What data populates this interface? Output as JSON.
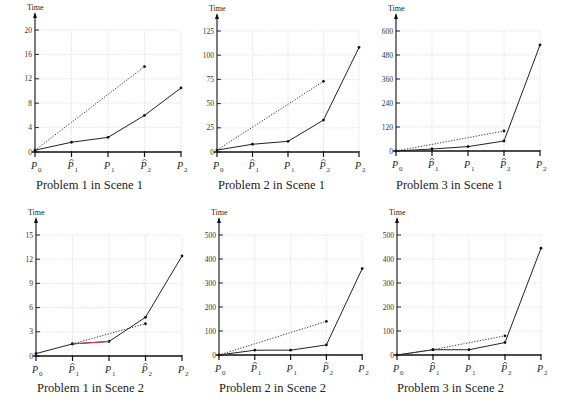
{
  "figure": {
    "y_axis_label": "Time",
    "x_tick_labels": [
      "P0",
      "P̂1",
      "P1",
      "P̂2",
      "P2"
    ],
    "colors": {
      "solid": "#222222",
      "dotted": "#333333",
      "highlight": "#d9334a",
      "grid": "#cfcfcf"
    }
  },
  "chart_data": [
    {
      "type": "line",
      "title": "Problem 1 in Scene 1",
      "ylabel": "Time",
      "categories": [
        "P0",
        "P̂1",
        "P1",
        "P̂2",
        "P2"
      ],
      "yticks": [
        0,
        4,
        8,
        12,
        16,
        20
      ],
      "ylim": [
        0,
        20
      ],
      "grid": true,
      "series": [
        {
          "name": "solid",
          "style": "solid",
          "x": [
            0,
            1,
            2,
            3,
            4
          ],
          "values": [
            0.3,
            1.6,
            2.4,
            6.0,
            10.5
          ]
        },
        {
          "name": "dotted",
          "style": "dotted",
          "x": [
            0,
            3
          ],
          "values": [
            0.3,
            14.0
          ]
        }
      ]
    },
    {
      "type": "line",
      "title": "Problem 2 in Scene 1",
      "ylabel": "Time",
      "categories": [
        "P0",
        "P̂1",
        "P1",
        "P̂2",
        "P2"
      ],
      "yticks": [
        0,
        25,
        50,
        75,
        100,
        125
      ],
      "ylim": [
        0,
        125
      ],
      "grid": true,
      "series": [
        {
          "name": "solid",
          "style": "solid",
          "x": [
            0,
            1,
            2,
            3,
            4
          ],
          "values": [
            2,
            8,
            11,
            33,
            108
          ]
        },
        {
          "name": "dotted",
          "style": "dotted",
          "x": [
            0,
            3
          ],
          "values": [
            2,
            73
          ]
        }
      ]
    },
    {
      "type": "line",
      "title": "Problem 3 in Scene 1",
      "ylabel": "Time",
      "categories": [
        "P0",
        "P̂1",
        "P1",
        "P̂2",
        "P2"
      ],
      "yticks": [
        0,
        120,
        240,
        360,
        480,
        600
      ],
      "ylim": [
        0,
        600
      ],
      "grid": true,
      "series": [
        {
          "name": "solid",
          "style": "solid",
          "x": [
            0,
            1,
            2,
            3,
            4
          ],
          "values": [
            0,
            10,
            22,
            50,
            530
          ]
        },
        {
          "name": "dotted",
          "style": "dotted",
          "x": [
            0,
            3
          ],
          "values": [
            0,
            100
          ]
        }
      ]
    },
    {
      "type": "line",
      "title": "Problem 1 in Scene 2",
      "ylabel": "Time",
      "categories": [
        "P0",
        "P̂1",
        "P1",
        "P̂2",
        "P2"
      ],
      "yticks": [
        0,
        3,
        6,
        9,
        12,
        15
      ],
      "ylim": [
        0,
        15
      ],
      "grid": true,
      "series": [
        {
          "name": "solid",
          "style": "solid",
          "x": [
            0,
            1,
            2,
            3,
            4
          ],
          "values": [
            0.3,
            1.5,
            1.8,
            4.8,
            12.4
          ]
        },
        {
          "name": "dotted",
          "style": "dotted",
          "x": [
            1,
            3
          ],
          "values": [
            1.5,
            4.0
          ]
        },
        {
          "name": "highlight",
          "style": "red",
          "x": [
            1,
            2
          ],
          "values": [
            1.5,
            1.8
          ]
        }
      ]
    },
    {
      "type": "line",
      "title": "Problem 2 in Scene 2",
      "ylabel": "Time",
      "categories": [
        "P0",
        "P̂1",
        "P1",
        "P̂2",
        "P2"
      ],
      "yticks": [
        0,
        100,
        200,
        300,
        400,
        500
      ],
      "ylim": [
        0,
        500
      ],
      "grid": true,
      "series": [
        {
          "name": "solid",
          "style": "solid",
          "x": [
            0,
            1,
            2,
            3,
            4
          ],
          "values": [
            0,
            20,
            20,
            42,
            360
          ]
        },
        {
          "name": "dotted",
          "style": "dotted",
          "x": [
            0,
            3
          ],
          "values": [
            0,
            140
          ]
        }
      ]
    },
    {
      "type": "line",
      "title": "Problem 3 in Scene 2",
      "ylabel": "Time",
      "categories": [
        "P0",
        "P̂1",
        "P1",
        "P̂2",
        "P2"
      ],
      "yticks": [
        0,
        100,
        200,
        300,
        400,
        500
      ],
      "ylim": [
        0,
        500
      ],
      "grid": true,
      "series": [
        {
          "name": "solid",
          "style": "solid",
          "x": [
            0,
            1,
            2,
            3,
            4
          ],
          "values": [
            0,
            22,
            22,
            52,
            445
          ]
        },
        {
          "name": "dotted",
          "style": "dotted",
          "x": [
            0,
            1,
            3
          ],
          "values": [
            0,
            22,
            80
          ]
        }
      ]
    }
  ]
}
